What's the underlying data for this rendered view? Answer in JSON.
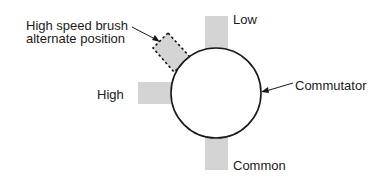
{
  "diagram": {
    "labels": {
      "alternate_line1": "High speed brush",
      "alternate_line2": "alternate position",
      "high": "High",
      "low": "Low",
      "common": "Common",
      "commutator": "Commutator"
    },
    "colors": {
      "brush_fill": "#d4d4d4",
      "stroke": "#1a1a1a",
      "background": "#ffffff"
    }
  }
}
